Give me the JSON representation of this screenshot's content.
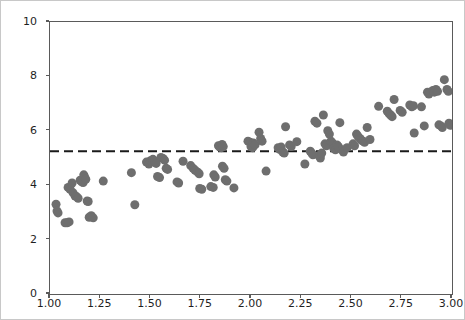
{
  "figure": {
    "background_color": "#ffffff",
    "border_color": "#c8c8c8",
    "axis_color": "#5a5a5a",
    "point_color": "#6e6e6e",
    "hline_color": "#1a1a1a"
  },
  "axes": {
    "y_tick_labels": [
      "0",
      "2",
      "4",
      "6",
      "8",
      "10"
    ],
    "x_tick_labels": [
      "1.00",
      "1.25",
      "1.50",
      "1.75",
      "2.00",
      "2.25",
      "2.50",
      "2.75",
      "3.00"
    ]
  },
  "chart_data": {
    "type": "scatter",
    "title": "",
    "xlabel": "",
    "ylabel": "",
    "xlim": [
      1.0,
      3.0
    ],
    "ylim": [
      0,
      10
    ],
    "xticks": [
      1.0,
      1.25,
      1.5,
      1.75,
      2.0,
      2.25,
      2.5,
      2.75,
      3.0
    ],
    "yticks": [
      0,
      2,
      4,
      6,
      8,
      10
    ],
    "grid": false,
    "legend": null,
    "marker": {
      "shape": "circle",
      "color": "#6e6e6e",
      "size_px": 9,
      "alpha": 1.0
    },
    "annotations": [
      {
        "type": "hline",
        "y": 5.25,
        "color": "#1a1a1a",
        "linestyle": "dashed",
        "linewidth": 2,
        "label": "mean"
      }
    ],
    "series": [
      {
        "name": "observations",
        "points": [
          [
            1.03,
            3.3
          ],
          [
            1.035,
            3.05
          ],
          [
            1.04,
            2.98
          ],
          [
            1.075,
            2.62
          ],
          [
            1.085,
            2.62
          ],
          [
            1.095,
            2.65
          ],
          [
            1.09,
            3.92
          ],
          [
            1.1,
            3.85
          ],
          [
            1.11,
            4.08
          ],
          [
            1.115,
            3.72
          ],
          [
            1.125,
            3.6
          ],
          [
            1.132,
            3.58
          ],
          [
            1.14,
            3.52
          ],
          [
            1.15,
            4.18
          ],
          [
            1.158,
            4.12
          ],
          [
            1.165,
            4.1
          ],
          [
            1.168,
            4.38
          ],
          [
            1.172,
            4.3
          ],
          [
            1.178,
            4.22
          ],
          [
            1.185,
            3.42
          ],
          [
            1.19,
            3.4
          ],
          [
            1.195,
            2.82
          ],
          [
            1.205,
            2.88
          ],
          [
            1.215,
            2.8
          ],
          [
            1.265,
            4.15
          ],
          [
            1.405,
            4.46
          ],
          [
            1.422,
            3.28
          ],
          [
            1.48,
            4.85
          ],
          [
            1.492,
            4.78
          ],
          [
            1.5,
            4.9
          ],
          [
            1.512,
            4.95
          ],
          [
            1.52,
            4.88
          ],
          [
            1.528,
            4.8
          ],
          [
            1.535,
            4.32
          ],
          [
            1.545,
            4.28
          ],
          [
            1.552,
            5.02
          ],
          [
            1.562,
            4.98
          ],
          [
            1.57,
            4.92
          ],
          [
            1.578,
            4.62
          ],
          [
            1.585,
            4.58
          ],
          [
            1.632,
            4.12
          ],
          [
            1.64,
            4.08
          ],
          [
            1.662,
            4.88
          ],
          [
            1.7,
            4.72
          ],
          [
            1.712,
            4.62
          ],
          [
            1.722,
            4.55
          ],
          [
            1.735,
            4.48
          ],
          [
            1.742,
            4.42
          ],
          [
            1.745,
            3.88
          ],
          [
            1.755,
            3.85
          ],
          [
            1.8,
            3.95
          ],
          [
            1.812,
            3.92
          ],
          [
            1.815,
            4.38
          ],
          [
            1.822,
            4.3
          ],
          [
            1.838,
            5.45
          ],
          [
            1.845,
            5.4
          ],
          [
            1.852,
            5.38
          ],
          [
            1.856,
            5.5
          ],
          [
            1.862,
            5.42
          ],
          [
            1.858,
            4.7
          ],
          [
            1.866,
            4.62
          ],
          [
            1.872,
            4.2
          ],
          [
            1.88,
            4.15
          ],
          [
            1.915,
            3.9
          ],
          [
            1.985,
            5.62
          ],
          [
            1.995,
            5.58
          ],
          [
            2.0,
            5.42
          ],
          [
            2.008,
            5.38
          ],
          [
            2.012,
            5.55
          ],
          [
            2.02,
            5.48
          ],
          [
            2.04,
            5.95
          ],
          [
            2.048,
            5.72
          ],
          [
            2.055,
            5.62
          ],
          [
            2.075,
            4.52
          ],
          [
            2.135,
            5.38
          ],
          [
            2.142,
            5.32
          ],
          [
            2.15,
            5.4
          ],
          [
            2.158,
            5.22
          ],
          [
            2.165,
            5.18
          ],
          [
            2.172,
            6.15
          ],
          [
            2.192,
            5.48
          ],
          [
            2.2,
            5.42
          ],
          [
            2.228,
            5.6
          ],
          [
            2.268,
            4.78
          ],
          [
            2.295,
            5.25
          ],
          [
            2.302,
            5.18
          ],
          [
            2.308,
            5.12
          ],
          [
            2.318,
            6.35
          ],
          [
            2.328,
            6.28
          ],
          [
            2.338,
            5.08
          ],
          [
            2.345,
            5.0
          ],
          [
            2.352,
            5.18
          ],
          [
            2.36,
            6.58
          ],
          [
            2.368,
            5.52
          ],
          [
            2.375,
            5.45
          ],
          [
            2.382,
            6.0
          ],
          [
            2.39,
            5.88
          ],
          [
            2.398,
            5.62
          ],
          [
            2.405,
            5.55
          ],
          [
            2.412,
            5.35
          ],
          [
            2.42,
            5.3
          ],
          [
            2.428,
            5.48
          ],
          [
            2.435,
            5.42
          ],
          [
            2.442,
            6.3
          ],
          [
            2.452,
            5.3
          ],
          [
            2.46,
            5.22
          ],
          [
            2.478,
            5.38
          ],
          [
            2.508,
            5.52
          ],
          [
            2.515,
            5.45
          ],
          [
            2.525,
            5.88
          ],
          [
            2.532,
            5.8
          ],
          [
            2.542,
            5.72
          ],
          [
            2.55,
            5.65
          ],
          [
            2.558,
            5.62
          ],
          [
            2.565,
            5.58
          ],
          [
            2.578,
            6.12
          ],
          [
            2.592,
            5.68
          ],
          [
            2.635,
            6.9
          ],
          [
            2.678,
            6.72
          ],
          [
            2.688,
            6.62
          ],
          [
            2.695,
            6.58
          ],
          [
            2.702,
            6.52
          ],
          [
            2.712,
            7.15
          ],
          [
            2.742,
            6.75
          ],
          [
            2.752,
            6.68
          ],
          [
            2.79,
            6.95
          ],
          [
            2.8,
            6.88
          ],
          [
            2.808,
            6.92
          ],
          [
            2.812,
            5.92
          ],
          [
            2.848,
            6.88
          ],
          [
            2.862,
            6.18
          ],
          [
            2.878,
            7.42
          ],
          [
            2.885,
            7.35
          ],
          [
            2.905,
            7.48
          ],
          [
            2.912,
            7.42
          ],
          [
            2.92,
            7.52
          ],
          [
            2.928,
            7.45
          ],
          [
            2.935,
            6.22
          ],
          [
            2.945,
            6.18
          ],
          [
            2.952,
            6.12
          ],
          [
            2.962,
            7.88
          ],
          [
            2.975,
            7.52
          ],
          [
            2.982,
            7.45
          ],
          [
            2.985,
            6.28
          ],
          [
            2.992,
            6.2
          ]
        ]
      }
    ]
  }
}
